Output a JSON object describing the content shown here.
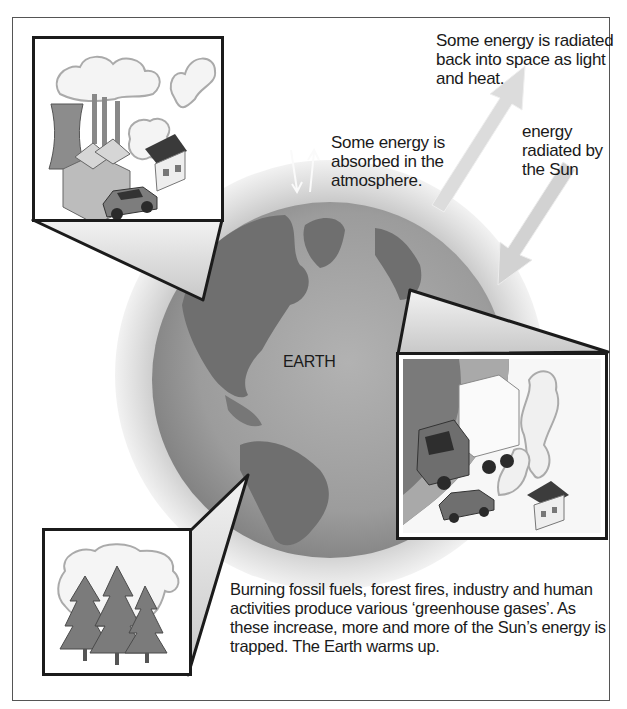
{
  "diagram": {
    "labels": {
      "radiated_back": "Some energy is radiated back into space as light and heat.",
      "absorbed": "Some energy is absorbed in the atmosphere.",
      "sun_energy": "energy radiated by the Sun",
      "earth": "EARTH",
      "caption": "Burning fossil fuels, forest fires, industry and human activities produce various ‘greenhouse gases’. As these increase, more and more of the Sun’s energy is trapped. The Earth warms up."
    },
    "insets": [
      {
        "id": "industry",
        "depicts": [
          "cooling tower",
          "factory",
          "chimney smoke",
          "house",
          "car"
        ]
      },
      {
        "id": "transport",
        "depicts": [
          "truck",
          "car",
          "exhaust smoke",
          "house"
        ]
      },
      {
        "id": "forest-fire",
        "depicts": [
          "burning trees",
          "smoke cloud"
        ]
      }
    ],
    "arrows": [
      {
        "id": "sun-incoming",
        "direction": "down-left"
      },
      {
        "id": "radiated-out",
        "direction": "up-right"
      },
      {
        "id": "atmosphere-exchange",
        "direction": "up-down pair"
      }
    ],
    "colors": {
      "earth_ocean": "#9a9a9a",
      "earth_land": "#6f6f6f",
      "atmosphere": "#d4d4d4",
      "outline": "#1b1b1b",
      "arrow": "#d8d8d8"
    }
  }
}
